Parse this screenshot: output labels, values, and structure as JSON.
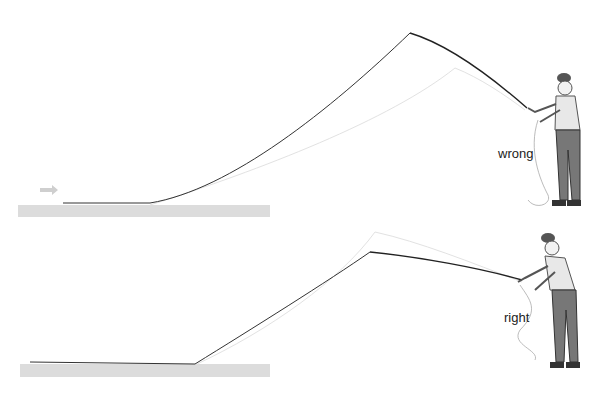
{
  "panels": [
    {
      "id": "wrong",
      "label": "wrong",
      "description": "Fly cast with high rod tip and bent rod; line peaks sharply and lands short of water surface",
      "line_path": "M63,203 L150,203 C230,190 330,110 410,33 C450,45 495,80 525,110",
      "ghost_path": "M150,205 C260,170 390,120 455,68 C480,78 505,95 525,110",
      "water": {
        "x": 18,
        "y": 205,
        "w": 252,
        "h": 12
      },
      "arrow": {
        "x": 40,
        "y": 188
      },
      "label_pos": {
        "x": 498,
        "y": 146
      }
    },
    {
      "id": "right",
      "label": "right",
      "description": "Fly cast with rod pointed forward, straighter line path",
      "line_path": "M30,362 L195,364 C250,330 330,280 370,252 C420,257 480,268 522,282",
      "ghost_path": "M195,365 C270,330 340,280 375,232 C420,242 470,262 522,282",
      "water": {
        "x": 20,
        "y": 364,
        "w": 250,
        "h": 13
      },
      "label_pos": {
        "x": 504,
        "y": 310
      }
    }
  ],
  "colors": {
    "line": "#333333",
    "ghost": "#dddddd",
    "water": "#d8d8d8",
    "arrow": "#cccccc"
  }
}
